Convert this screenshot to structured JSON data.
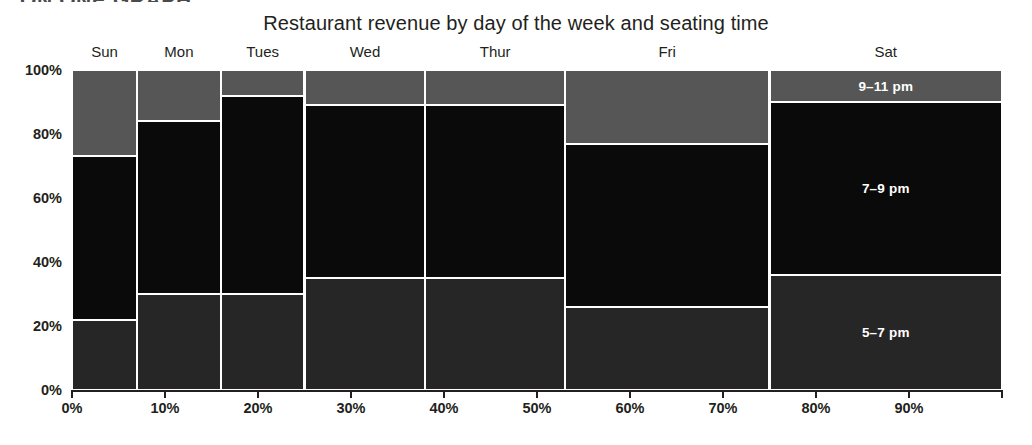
{
  "section_kicker": "ON ONE GRAPH",
  "chart_title": "Restaurant revenue by day of the week and seating time",
  "axes": {
    "y_ticks": [
      "0%",
      "20%",
      "40%",
      "60%",
      "80%",
      "100%"
    ],
    "y_tick_values": [
      0,
      20,
      40,
      60,
      80,
      100
    ],
    "x_ticks": [
      "0%",
      "10%",
      "20%",
      "30%",
      "40%",
      "50%",
      "60%",
      "70%",
      "80%",
      "90%",
      ""
    ],
    "x_tick_values": [
      0,
      10,
      20,
      30,
      40,
      50,
      60,
      70,
      80,
      90,
      100
    ]
  },
  "colors": {
    "seating_5_7pm": "#262626",
    "seating_7_9pm": "#0a0a0a",
    "seating_9_11pm": "#565656",
    "divider": "#ffffff",
    "axis": "#231f20",
    "text": "#231f20",
    "label_on_dark": "#ffffff",
    "background": "#ffffff"
  },
  "chart_data": {
    "type": "bar",
    "subtype": "mosaic",
    "title": "Restaurant revenue by day of the week and seating time",
    "xlabel": "",
    "ylabel": "",
    "xlim": [
      0,
      100
    ],
    "ylim": [
      0,
      100
    ],
    "grid": false,
    "legend_position": "inline-on-last-column",
    "categories": [
      "Sun",
      "Mon",
      "Tues",
      "Wed",
      "Thur",
      "Fri",
      "Sat"
    ],
    "column_widths_pct": [
      7,
      9,
      9,
      13,
      15,
      22,
      25
    ],
    "column_spans_pct": [
      [
        0,
        7
      ],
      [
        7,
        16
      ],
      [
        16,
        25
      ],
      [
        25,
        38
      ],
      [
        38,
        53
      ],
      [
        53,
        75
      ],
      [
        75,
        100
      ]
    ],
    "series": [
      {
        "name": "5–7 pm",
        "values": [
          22,
          30,
          30,
          35,
          35,
          26,
          36
        ]
      },
      {
        "name": "7–9 pm",
        "values": [
          51,
          54,
          62,
          54,
          54,
          51,
          54
        ]
      },
      {
        "name": "9–11 pm",
        "values": [
          27,
          16,
          8,
          11,
          11,
          23,
          10
        ]
      }
    ],
    "stack_boundaries_pct": {
      "Sun": {
        "bottom_of_7_9": 22,
        "top_of_7_9": 73
      },
      "Mon": {
        "bottom_of_7_9": 30,
        "top_of_7_9": 84
      },
      "Tues": {
        "bottom_of_7_9": 30,
        "top_of_7_9": 92
      },
      "Wed": {
        "bottom_of_7_9": 35,
        "top_of_7_9": 89
      },
      "Thur": {
        "bottom_of_7_9": 35,
        "top_of_7_9": 89
      },
      "Fri": {
        "bottom_of_7_9": 26,
        "top_of_7_9": 77
      },
      "Sat": {
        "bottom_of_7_9": 36,
        "top_of_7_9": 90
      }
    },
    "inline_labels": {
      "column": "Sat",
      "labels": [
        "9–11 pm",
        "7–9 pm",
        "5–7 pm"
      ]
    }
  }
}
